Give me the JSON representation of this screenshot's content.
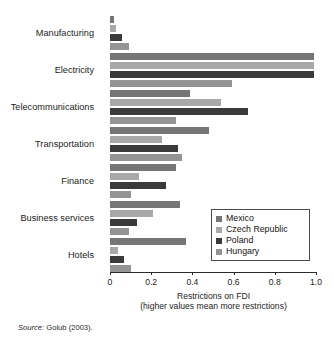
{
  "figure": {
    "clipped_title": "",
    "source_prefix": "Source:",
    "source_text": "Golub (2003)."
  },
  "chart_data": {
    "type": "bar",
    "orientation": "horizontal",
    "title": "",
    "xlabel_line1": "Restrictions on FDI",
    "xlabel_line2": "(higher values mean more restrictions)",
    "ylabel": "",
    "categories": [
      "Manufacturing",
      "Electricity",
      "Telecommunications",
      "Transportation",
      "Finance",
      "Business services",
      "Hotels"
    ],
    "series": [
      {
        "name": "Mexico",
        "color": "#767676",
        "values": [
          0.02,
          0.99,
          0.39,
          0.48,
          0.32,
          0.34,
          0.37
        ]
      },
      {
        "name": "Czech Republic",
        "color": "#a8a8a8",
        "values": [
          0.03,
          0.99,
          0.54,
          0.25,
          0.14,
          0.21,
          0.04
        ]
      },
      {
        "name": "Poland",
        "color": "#3a3a3a",
        "values": [
          0.06,
          0.99,
          0.67,
          0.33,
          0.27,
          0.13,
          0.07
        ]
      },
      {
        "name": "Hungary",
        "color": "#949494",
        "values": [
          0.09,
          0.59,
          0.32,
          0.35,
          0.1,
          0.09,
          0.1
        ]
      }
    ],
    "xlim": [
      0,
      1.0
    ],
    "xticks": [
      0,
      0.2,
      0.4,
      0.6,
      0.8,
      1.0
    ],
    "xtick_labels": [
      "0",
      "0.2",
      "0.4",
      "0.6",
      "0.8",
      "1.0"
    ],
    "grid": false,
    "legend_position": "lower-right",
    "legend_entries": [
      "Mexico",
      "Czech Republic",
      "Poland",
      "Hungary"
    ]
  }
}
